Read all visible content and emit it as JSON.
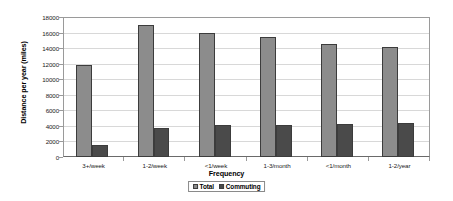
{
  "chart_data": {
    "type": "bar",
    "title": "",
    "xlabel": "Frequency",
    "ylabel": "Distance per year (miles)",
    "categories": [
      "3+/week",
      "1-2/week",
      "<1/week",
      "1-3/month",
      "<1/month",
      "1-2/year"
    ],
    "series": [
      {
        "name": "Total",
        "color": "#8c8c8c",
        "values": [
          11800,
          17000,
          16000,
          15400,
          14500,
          14100
        ]
      },
      {
        "name": "Commuting",
        "color": "#4a4a4a",
        "values": [
          1500,
          3700,
          4100,
          4100,
          4300,
          4400
        ]
      }
    ],
    "ylim": [
      0,
      18000
    ],
    "ytick_labels": [
      "18000",
      "16000",
      "14000",
      "12000",
      "10000",
      "8000",
      "6000",
      "4000",
      "2000",
      "0"
    ],
    "ytick_values": [
      18000,
      16000,
      14000,
      12000,
      10000,
      8000,
      6000,
      4000,
      2000,
      0
    ],
    "grid": true,
    "legend_position": "bottom"
  }
}
